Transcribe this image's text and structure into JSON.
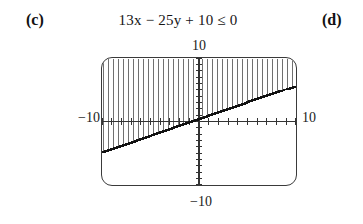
{
  "labels": {
    "part_c": "(c)",
    "part_d": "(d)"
  },
  "expression": {
    "full": "13x − 25y + 10 ≤ 0",
    "coefficient_x": "13",
    "var_x": "x",
    "operator_1": "−",
    "coefficient_y": "25",
    "var_y": "y",
    "operator_2": "+",
    "constant": "10",
    "relation": "≤",
    "rhs": "0"
  },
  "graph": {
    "top_label": "10",
    "bottom_label": "−10",
    "left_label": "−10",
    "right_label": "10",
    "window": {
      "xmin": -10,
      "xmax": 10,
      "ymin": -10,
      "ymax": 10,
      "xscl": 1,
      "yscl": 1
    },
    "line_color": "#111111",
    "shade_color": "#555555",
    "axis_color": "#333333",
    "frame_color": "#3a3a3a"
  },
  "chart_data": {
    "type": "line",
    "title": "13x − 25y + 10 ≤ 0",
    "xlabel": "",
    "ylabel": "",
    "xlim": [
      -10,
      10
    ],
    "ylim": [
      -10,
      10
    ],
    "xticks": [
      -10,
      -9,
      -8,
      -7,
      -6,
      -5,
      -4,
      -3,
      -2,
      -1,
      0,
      1,
      2,
      3,
      4,
      5,
      6,
      7,
      8,
      9,
      10
    ],
    "yticks": [
      -10,
      -9,
      -8,
      -7,
      -6,
      -5,
      -4,
      -3,
      -2,
      -1,
      0,
      1,
      2,
      3,
      4,
      5,
      6,
      7,
      8,
      9,
      10
    ],
    "tick_labels_shown": [
      "10",
      "−10",
      "−10",
      "10"
    ],
    "grid": false,
    "legend": null,
    "series": [
      {
        "name": "13x − 25y + 10 = 0",
        "kind": "boundary-line",
        "style": "solid",
        "slope": 0.52,
        "intercept": 0.4,
        "x": [
          -10,
          -5,
          0,
          5,
          10
        ],
        "values": [
          -4.8,
          -2.2,
          0.4,
          3.0,
          5.6
        ]
      },
      {
        "name": "solution region 13x − 25y + 10 ≤ 0",
        "kind": "shaded-region",
        "fill": "vertical-hatch",
        "side": "above",
        "description": "region above and including the boundary line y ≥ (13x + 10)/25"
      }
    ]
  }
}
